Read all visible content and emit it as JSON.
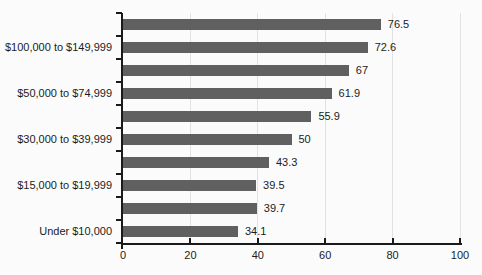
{
  "chart_data": {
    "type": "bar",
    "orientation": "horizontal",
    "title": "",
    "xlabel": "",
    "ylabel": "",
    "xlim": [
      0,
      100
    ],
    "grid": true,
    "bar_color": "#606060",
    "axis_color": "#1a1a1a",
    "gridline_color": "#e2e2e2",
    "x_ticks": [
      0,
      20,
      40,
      60,
      80,
      100
    ],
    "x_tick_labels": [
      "0",
      "20",
      "40",
      "60",
      "80",
      "100"
    ],
    "bars": [
      {
        "label": "",
        "value": 76.5,
        "value_label": "76.5"
      },
      {
        "label": "$100,000 to $149,999",
        "value": 72.6,
        "value_label": "72.6"
      },
      {
        "label": "",
        "value": 67,
        "value_label": "67"
      },
      {
        "label": "$50,000 to $74,999",
        "value": 61.9,
        "value_label": "61.9"
      },
      {
        "label": "",
        "value": 55.9,
        "value_label": "55.9"
      },
      {
        "label": "$30,000 to $39,999",
        "value": 50,
        "value_label": "50"
      },
      {
        "label": "",
        "value": 43.3,
        "value_label": "43.3"
      },
      {
        "label": "$15,000 to $19,999",
        "value": 39.5,
        "value_label": "39.5"
      },
      {
        "label": "",
        "value": 39.7,
        "value_label": "39.7"
      },
      {
        "label": "Under $10,000",
        "value": 34.1,
        "value_label": "34.1"
      }
    ]
  }
}
